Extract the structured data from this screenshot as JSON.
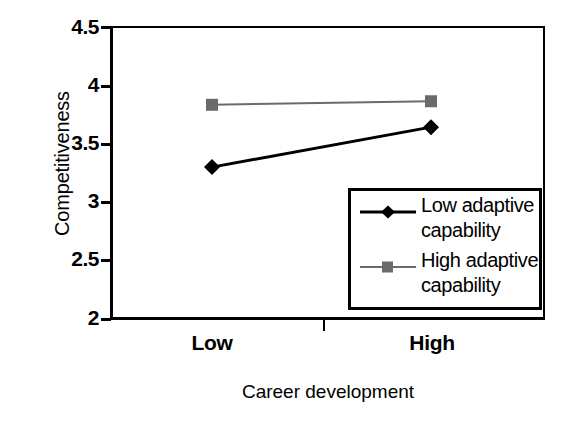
{
  "chart_data": {
    "type": "line",
    "title": "",
    "subtitle": "",
    "xlabel": "Career development",
    "ylabel": "Competitiveness",
    "categories": [
      "Low",
      "High"
    ],
    "x": [
      0,
      1
    ],
    "ylim": [
      2,
      4.5
    ],
    "yticks": [
      "2",
      "2.5",
      "3",
      "3.5",
      "4",
      "4.5"
    ],
    "ytick_values": [
      2,
      2.5,
      3,
      3.5,
      4,
      4.5
    ],
    "grid": false,
    "legend_position": "bottom-right",
    "series": [
      {
        "name": "Low adaptive capability",
        "name_line1": "Low adaptive",
        "name_line2": "capability",
        "values": [
          3.3,
          3.64
        ],
        "marker": "diamond",
        "color": "#000000",
        "line_width": 3
      },
      {
        "name": "High adaptive capability",
        "name_line1": "High adaptive",
        "name_line2": "capability",
        "values": [
          3.83,
          3.86
        ],
        "marker": "square",
        "color": "#6b6b6b",
        "line_width": 2
      }
    ]
  },
  "axes": {
    "y": {
      "label": "Competitiveness",
      "ticks": [
        {
          "label": "4.5",
          "value": 4.5
        },
        {
          "label": "4",
          "value": 4
        },
        {
          "label": "3.5",
          "value": 3.5
        },
        {
          "label": "3",
          "value": 3
        },
        {
          "label": "2.5",
          "value": 2.5
        },
        {
          "label": "2",
          "value": 2
        }
      ]
    },
    "x": {
      "label": "Career development",
      "ticks": [
        {
          "label": "Low"
        },
        {
          "label": "High"
        }
      ]
    }
  },
  "legend": {
    "entries": [
      {
        "line1": "Low adaptive",
        "line2": "capability",
        "marker": "diamond-marker",
        "color": "#000000"
      },
      {
        "line1": "High adaptive",
        "line2": "capability",
        "marker": "square-marker",
        "color": "#6b6b6b"
      }
    ]
  },
  "colors": {
    "background": "#ffffff",
    "axis": "#000000",
    "series_low": "#000000",
    "series_high": "#6b6b6b"
  }
}
